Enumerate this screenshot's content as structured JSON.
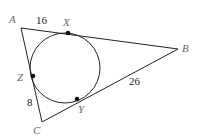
{
  "diagram": {
    "type": "triangle-with-inscribed-circle",
    "vertices": {
      "A": "A",
      "B": "B",
      "C": "C"
    },
    "tangent_points": {
      "X": "X",
      "Y": "Y",
      "Z": "Z"
    },
    "segment_labels": {
      "AX": "16",
      "CZ": "8",
      "BY": "26"
    },
    "colors": {
      "line": "#222222",
      "label": "#666666"
    }
  }
}
